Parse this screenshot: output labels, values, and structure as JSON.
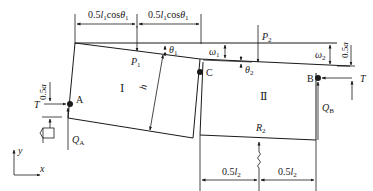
{
  "diagram": {
    "regions": [
      {
        "id": "I",
        "label": "Ⅰ"
      },
      {
        "id": "II",
        "label": "Ⅱ"
      }
    ],
    "nodes": {
      "A": {
        "label": "A"
      },
      "B": {
        "label": "B"
      },
      "C": {
        "label": "C"
      }
    },
    "dimensions": {
      "top_left": {
        "coef": "0.5",
        "var": "l",
        "sub": "1",
        "fn": "cos",
        "angle": "θ",
        "angle_sub": "1"
      },
      "top_right": {
        "coef": "0.5",
        "var": "l",
        "sub": "1",
        "fn": "cos",
        "angle": "θ",
        "angle_sub": "1"
      },
      "bottom_left": {
        "coef": "0.5",
        "var": "l",
        "sub": "2"
      },
      "bottom_right": {
        "coef": "0.5",
        "var": "l",
        "sub": "2"
      },
      "height": {
        "var": "h"
      },
      "offset_left": {
        "coef": "0.5",
        "var": "a"
      },
      "offset_right": {
        "coef": "0.5",
        "var": "a"
      }
    },
    "forces": {
      "P1": {
        "var": "P",
        "sub": "1"
      },
      "P2": {
        "var": "P",
        "sub": "2"
      },
      "R2": {
        "var": "R",
        "sub": "2"
      },
      "QA": {
        "var": "Q",
        "sub": "A"
      },
      "QB": {
        "var": "Q",
        "sub": "B"
      },
      "T_left": {
        "var": "T"
      },
      "T_right": {
        "var": "T"
      }
    },
    "angles": {
      "theta1": {
        "var": "θ",
        "sub": "1"
      },
      "theta2": {
        "var": "θ",
        "sub": "2"
      },
      "omega1": {
        "var": "ω",
        "sub": "1"
      },
      "omega2": {
        "var": "ω",
        "sub": "2"
      }
    },
    "axes": {
      "x": "x",
      "y": "y"
    }
  }
}
